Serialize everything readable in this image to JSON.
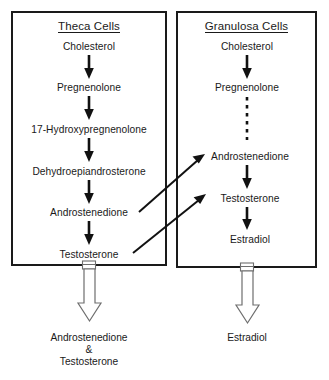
{
  "diagram": {
    "compartments": [
      {
        "id": "theca",
        "title": "Theca Cells",
        "steps": [
          "Cholesterol",
          "Pregnenolone",
          "17-Hydroxypregnenolone",
          "Dehydroepiandrosterone",
          "Androstenedione",
          "Testosterone"
        ],
        "output_label_lines": [
          "Androstenedione",
          "&",
          "Testosterone"
        ]
      },
      {
        "id": "granulosa",
        "title": "Granulosa Cells",
        "steps": [
          "Cholesterol",
          "Pregnenolone",
          "Androstenedione",
          "Testosterone",
          "Estradiol"
        ],
        "output_label_lines": [
          "Estradiol"
        ]
      }
    ],
    "connections": [
      {
        "from": "theca.Androstenedione",
        "to": "granulosa.Androstenedione",
        "style": "solid-diagonal"
      },
      {
        "from": "theca.Testosterone",
        "to": "granulosa.Testosterone",
        "style": "solid-diagonal"
      }
    ],
    "internal_links": {
      "granulosa_pregnenolone_to_androstenedione": "dashed"
    },
    "colors": {
      "stroke": "#111111",
      "box_border": "#1a1a1a",
      "text": "#1a1a1a",
      "block_arrow_outline": "#6e6e6e",
      "background": "#ffffff"
    }
  }
}
